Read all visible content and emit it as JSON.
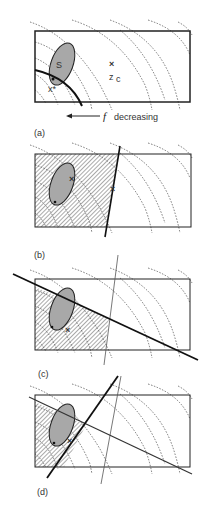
{
  "figure": {
    "panels": [
      {
        "id": "a",
        "label": "(a)",
        "set_label": "S",
        "point_opt": "x*",
        "point_center": "z",
        "center_sub": "c"
      },
      {
        "id": "b",
        "label": "(b)"
      },
      {
        "id": "c",
        "label": "(c)"
      },
      {
        "id": "d",
        "label": "(d)"
      }
    ],
    "arrow_caption": {
      "symbol": "f",
      "text": "decreasing"
    },
    "colors": {
      "ellipse_fill": "#a8a8a8",
      "line": "#222222",
      "contour": "#555555",
      "hatch": "#555555"
    }
  }
}
